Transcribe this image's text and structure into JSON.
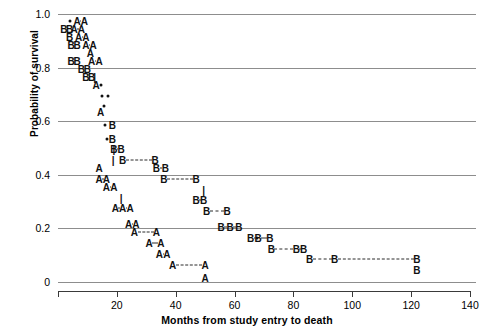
{
  "chart_data": {
    "type": "line",
    "title": "",
    "xlabel": "Months from study entry to death",
    "ylabel": "Probability of survival",
    "xlim": [
      0,
      140
    ],
    "ylim": [
      0,
      1.0
    ],
    "xticks": [
      0,
      20,
      40,
      60,
      80,
      100,
      120,
      140
    ],
    "xticklabels": [
      "",
      "20",
      "40",
      "60",
      "80",
      "100",
      "120",
      "140"
    ],
    "yticks": [
      0,
      0.2,
      0.4,
      0.6,
      0.8,
      1.0
    ],
    "yticklabels": [
      "0",
      "0.2",
      "0.4",
      "0.6",
      "0.8",
      "1.0"
    ],
    "grid": "horizontal",
    "legend": "none",
    "series": [
      {
        "name": "A",
        "marker": "A",
        "points": [
          {
            "x": 6.5,
            "y": 0.975
          },
          {
            "x": 9.0,
            "y": 0.975
          },
          {
            "x": 5.5,
            "y": 0.945
          },
          {
            "x": 8.0,
            "y": 0.945
          },
          {
            "x": 7.0,
            "y": 0.915
          },
          {
            "x": 9.5,
            "y": 0.915
          },
          {
            "x": 9.5,
            "y": 0.885
          },
          {
            "x": 12.0,
            "y": 0.885
          },
          {
            "x": 11.0,
            "y": 0.855
          },
          {
            "x": 11.5,
            "y": 0.825
          },
          {
            "x": 14.0,
            "y": 0.825
          },
          {
            "x": 13.0,
            "y": 0.735
          },
          {
            "x": 14.5,
            "y": 0.635
          },
          {
            "x": 14.0,
            "y": 0.425
          },
          {
            "x": 14.0,
            "y": 0.385
          },
          {
            "x": 16.5,
            "y": 0.385
          },
          {
            "x": 16.5,
            "y": 0.355
          },
          {
            "x": 19.0,
            "y": 0.355
          },
          {
            "x": 19.5,
            "y": 0.275
          },
          {
            "x": 22.0,
            "y": 0.275
          },
          {
            "x": 24.5,
            "y": 0.275
          },
          {
            "x": 24.0,
            "y": 0.215
          },
          {
            "x": 26.5,
            "y": 0.215
          },
          {
            "x": 26.0,
            "y": 0.185
          },
          {
            "x": 33.5,
            "y": 0.185
          },
          {
            "x": 31.0,
            "y": 0.145
          },
          {
            "x": 35.0,
            "y": 0.145
          },
          {
            "x": 34.5,
            "y": 0.105
          },
          {
            "x": 37.0,
            "y": 0.105
          },
          {
            "x": 39.0,
            "y": 0.065
          },
          {
            "x": 50.0,
            "y": 0.065
          },
          {
            "x": 50.0,
            "y": 0.015
          }
        ]
      },
      {
        "name": "B",
        "marker": "B",
        "points": [
          {
            "x": 2.0,
            "y": 0.945
          },
          {
            "x": 4.0,
            "y": 0.945
          },
          {
            "x": 4.0,
            "y": 0.915
          },
          {
            "x": 4.5,
            "y": 0.885
          },
          {
            "x": 6.5,
            "y": 0.885
          },
          {
            "x": 4.5,
            "y": 0.825
          },
          {
            "x": 6.5,
            "y": 0.825
          },
          {
            "x": 8.0,
            "y": 0.795
          },
          {
            "x": 10.0,
            "y": 0.795
          },
          {
            "x": 9.5,
            "y": 0.765
          },
          {
            "x": 11.5,
            "y": 0.765
          },
          {
            "x": 18.5,
            "y": 0.585
          },
          {
            "x": 18.5,
            "y": 0.535
          },
          {
            "x": 19.0,
            "y": 0.495
          },
          {
            "x": 21.5,
            "y": 0.495
          },
          {
            "x": 22.0,
            "y": 0.455
          },
          {
            "x": 33.0,
            "y": 0.455
          },
          {
            "x": 33.5,
            "y": 0.425
          },
          {
            "x": 36.5,
            "y": 0.425
          },
          {
            "x": 36.0,
            "y": 0.385
          },
          {
            "x": 47.0,
            "y": 0.385
          },
          {
            "x": 47.0,
            "y": 0.305
          },
          {
            "x": 49.5,
            "y": 0.305
          },
          {
            "x": 50.5,
            "y": 0.265
          },
          {
            "x": 57.5,
            "y": 0.265
          },
          {
            "x": 55.5,
            "y": 0.205
          },
          {
            "x": 58.5,
            "y": 0.205
          },
          {
            "x": 61.5,
            "y": 0.205
          },
          {
            "x": 65.5,
            "y": 0.165
          },
          {
            "x": 68.0,
            "y": 0.165
          },
          {
            "x": 72.0,
            "y": 0.165
          },
          {
            "x": 72.5,
            "y": 0.125
          },
          {
            "x": 81.0,
            "y": 0.125
          },
          {
            "x": 83.5,
            "y": 0.125
          },
          {
            "x": 85.5,
            "y": 0.085
          },
          {
            "x": 94.0,
            "y": 0.085
          },
          {
            "x": 122.0,
            "y": 0.085
          },
          {
            "x": 122.0,
            "y": 0.045
          }
        ]
      },
      {
        "name": "censored",
        "marker": "dot",
        "points": [
          {
            "x": 4.0,
            "y": 0.975
          },
          {
            "x": 14.5,
            "y": 0.735
          },
          {
            "x": 15.0,
            "y": 0.695
          },
          {
            "x": 17.0,
            "y": 0.695
          },
          {
            "x": 15.5,
            "y": 0.655
          },
          {
            "x": 16.0,
            "y": 0.585
          },
          {
            "x": 16.5,
            "y": 0.535
          },
          {
            "x": 67.5,
            "y": 0.165
          }
        ]
      }
    ],
    "tick_glyphs": [
      {
        "x": 12.5,
        "y": 0.765,
        "label": "|"
      },
      {
        "x": 19.0,
        "y": 0.495,
        "label": "|"
      },
      {
        "x": 18.8,
        "y": 0.455,
        "label": "|"
      },
      {
        "x": 21.5,
        "y": 0.315,
        "label": "|"
      },
      {
        "x": 49.5,
        "y": 0.345,
        "label": "|"
      }
    ]
  },
  "axes": {
    "y_title": "Probability of survival",
    "x_title": "Months from study entry to death"
  }
}
